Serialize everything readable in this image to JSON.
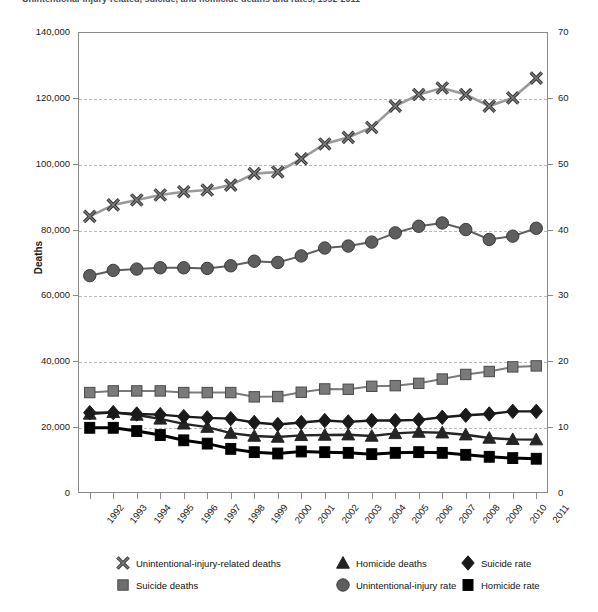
{
  "title": {
    "text": "Unintentional-injury-related, suicide, and homicide deaths and rates, 1992-2011",
    "clipped": true
  },
  "axes": {
    "left": {
      "label": "Deaths",
      "ticks": [
        "0",
        "20,000",
        "40,000",
        "60,000",
        "80,000",
        "100,000",
        "120,000",
        "140,000"
      ],
      "min": 0,
      "max": 140000
    },
    "right": {
      "label": "",
      "ticks": [
        "0",
        "10",
        "20",
        "30",
        "40",
        "50",
        "60",
        "70"
      ],
      "min": 0,
      "max": 70
    },
    "x": {
      "label": "",
      "ticks": [
        "1992",
        "1993",
        "1994",
        "1995",
        "1996",
        "1997",
        "1998",
        "1999",
        "2000",
        "2001",
        "2002",
        "2003",
        "2004",
        "2005",
        "2006",
        "2007",
        "2008",
        "2009",
        "2010",
        "2011"
      ]
    }
  },
  "legend": {
    "columns": [
      [
        {
          "marker": "x-marker",
          "label": "Unintentional-injury-related deaths",
          "color": "#9a9a9a"
        },
        {
          "marker": "square-marker",
          "label": "Suicide deaths",
          "color": "#6e6e6e"
        }
      ],
      [
        {
          "marker": "triangle-marker",
          "label": "Homicide deaths",
          "color": "#222222"
        },
        {
          "marker": "circle-marker",
          "label": "Unintentional-injury rate",
          "color": "#5e5e5e"
        }
      ],
      [
        {
          "marker": "diamond-marker",
          "label": "Suicide rate",
          "color": "#1a1a1a"
        },
        {
          "marker": "blacksquare-marker",
          "label": "Homicide rate",
          "color": "#000000"
        }
      ]
    ]
  },
  "colors": {
    "unintentional_deaths": "#9a9a9a",
    "suicide_deaths": "#7a7a7a",
    "homicide_deaths": "#252525",
    "unintentional_rate": "#5e5e5e",
    "suicide_rate": "#1a1a1a",
    "homicide_rate": "#000000",
    "grid": "#b9b9b9",
    "frame": "#8a8a8a"
  },
  "chart_data": {
    "type": "line",
    "title": "Unintentional-injury-related, suicide, and homicide deaths and rates, 1992-2011",
    "xlabel": "",
    "ylabel": "Deaths",
    "y2label": "",
    "categories": [
      "1992",
      "1993",
      "1994",
      "1995",
      "1996",
      "1997",
      "1998",
      "1999",
      "2000",
      "2001",
      "2002",
      "2003",
      "2004",
      "2005",
      "2006",
      "2007",
      "2008",
      "2009",
      "2010",
      "2011"
    ],
    "ylim": [
      0,
      140000
    ],
    "y2lim": [
      0,
      70
    ],
    "grid": true,
    "legend_position": "bottom",
    "series": [
      {
        "name": "Unintentional-injury-related deaths",
        "axis": "left",
        "marker": "x",
        "color": "#9a9a9a",
        "values": [
          84000,
          87500,
          89000,
          90500,
          91500,
          92000,
          93500,
          97000,
          97500,
          101500,
          106000,
          108000,
          111000,
          117500,
          121000,
          123000,
          121000,
          117500,
          120000,
          126000
        ]
      },
      {
        "name": "Suicide deaths",
        "axis": "left",
        "marker": "square",
        "color": "#7a7a7a",
        "values": [
          30500,
          31000,
          31000,
          31000,
          30500,
          30500,
          30500,
          29200,
          29300,
          30600,
          31600,
          31500,
          32400,
          32600,
          33300,
          34600,
          36000,
          36900,
          38300,
          38600
        ]
      },
      {
        "name": "Homicide deaths",
        "axis": "left",
        "marker": "triangle",
        "color": "#252525",
        "values": [
          24000,
          24500,
          23700,
          22500,
          21000,
          20000,
          18200,
          17300,
          17000,
          17500,
          17600,
          17700,
          17300,
          18100,
          18500,
          18300,
          17700,
          16700,
          16300,
          16200
        ]
      },
      {
        "name": "Unintentional-injury rate",
        "axis": "right",
        "marker": "circle",
        "color": "#5e5e5e",
        "values": [
          33.0,
          33.8,
          34.0,
          34.2,
          34.2,
          34.1,
          34.5,
          35.2,
          35.0,
          36.0,
          37.2,
          37.5,
          38.1,
          39.5,
          40.5,
          41.0,
          40.0,
          38.5,
          39.0,
          40.2
        ]
      },
      {
        "name": "Suicide rate",
        "axis": "right",
        "marker": "diamond",
        "color": "#1a1a1a",
        "values": [
          12.2,
          12.2,
          12.0,
          11.9,
          11.6,
          11.4,
          11.3,
          10.7,
          10.4,
          10.7,
          11.0,
          10.8,
          11.0,
          11.0,
          11.1,
          11.5,
          11.8,
          12.0,
          12.4,
          12.4
        ]
      },
      {
        "name": "Homicide rate",
        "axis": "right",
        "marker": "blacksquare",
        "color": "#000000",
        "values": [
          9.9,
          9.9,
          9.4,
          8.8,
          8.0,
          7.5,
          6.7,
          6.2,
          6.0,
          6.3,
          6.2,
          6.1,
          5.9,
          6.1,
          6.2,
          6.1,
          5.8,
          5.5,
          5.3,
          5.2
        ]
      }
    ]
  }
}
